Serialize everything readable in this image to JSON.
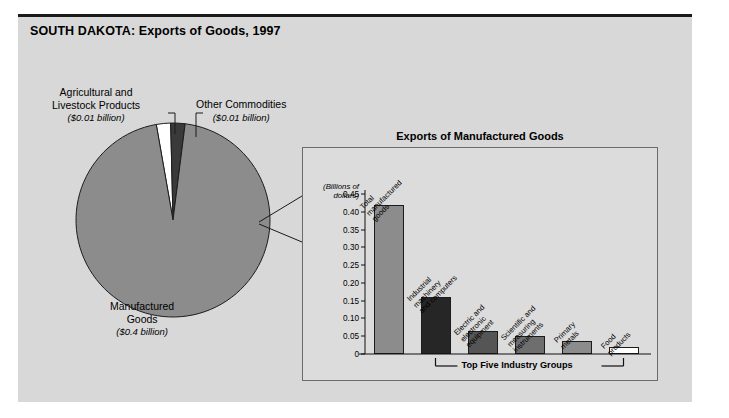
{
  "page": {
    "title": "SOUTH DAKOTA: Exports of Goods, 1997",
    "panel_bg": "#d8d8d8",
    "rule_color": "#1a1a1a"
  },
  "pie": {
    "slices": [
      {
        "label_line1": "Manufactured",
        "label_line2": "Goods",
        "value_text": "($0.4 billion)",
        "value": 0.4,
        "color": "#8c8c8c"
      },
      {
        "label_line1": "Agricultural and",
        "label_line2": "Livestock Products",
        "value_text": "($0.01 billion)",
        "value": 0.01,
        "color": "#ffffff"
      },
      {
        "label_line1": "Other Commodities",
        "label_line2": "",
        "value_text": "($0.01 billion)",
        "value": 0.01,
        "color": "#3a3a3a"
      }
    ]
  },
  "inset": {
    "title": "Exports of Manufactured Goods",
    "axis_caption_line1": "(Billions of",
    "axis_caption_line2": "dollars)",
    "bracket_label": "Top Five Industry Groups"
  },
  "chart_data": {
    "type": "bar",
    "title": "Exports of Manufactured Goods",
    "xlabel": "",
    "ylabel": "(Billions of dollars)",
    "ylim": [
      0,
      0.45
    ],
    "yticks": [
      "0",
      "0.05",
      "0.10",
      "0.15",
      "0.20",
      "0.25",
      "0.30",
      "0.35",
      "0.40",
      "0.45"
    ],
    "ytick_values": [
      0,
      0.05,
      0.1,
      0.15,
      0.2,
      0.25,
      0.3,
      0.35,
      0.4,
      0.45
    ],
    "grid": false,
    "legend": "none",
    "categories": [
      "Total manufactured goods",
      "Industrial machinery and computers",
      "Electric and electronic equipment",
      "Scientific and measuring instruments",
      "Primary metals",
      "Food products"
    ],
    "category_lines": [
      [
        "Total",
        "manufactured",
        "goods"
      ],
      [
        "Industrial",
        "machinery",
        "and computers"
      ],
      [
        "Electric and",
        "electronic",
        "equipment"
      ],
      [
        "Scientific and",
        "measuring",
        "instruments"
      ],
      [
        "Primary",
        "metals"
      ],
      [
        "Food",
        "products"
      ]
    ],
    "values": [
      0.42,
      0.16,
      0.065,
      0.05,
      0.037,
      0.02
    ],
    "colors": [
      "#8c8c8c",
      "#262626",
      "#555555",
      "#6e6e6e",
      "#8c8c8c",
      "#ffffff"
    ],
    "annotations": [
      "Top Five Industry Groups"
    ]
  }
}
